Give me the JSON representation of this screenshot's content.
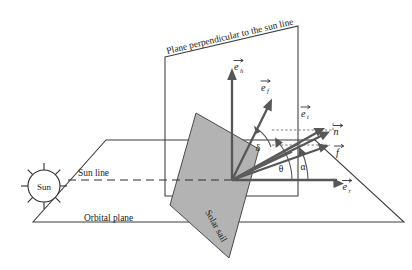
{
  "figure": {
    "background_color": "#ffffff",
    "sail_fill_color": "#b3b3b3",
    "line_color": "#3c3c3c",
    "vector_color": "#575757"
  },
  "labels": {
    "sun": "Sun",
    "sun_line": "Sun line",
    "orbital_plane": "Orbital plane",
    "perpendicular_plane": "Plane perpendicular to the sun line",
    "solar_sail": "Solar sail"
  },
  "vectors": [
    {
      "id": "e_h",
      "base": "e",
      "sub": "h",
      "label": "e_h",
      "description": "out-of-plane unit vector"
    },
    {
      "id": "e_f",
      "base": "e",
      "sub": "f",
      "label": "e_f",
      "description": "transverse unit vector"
    },
    {
      "id": "e_t",
      "base": "e",
      "sub": "t",
      "label": "e_t",
      "description": "tangential unit vector"
    },
    {
      "id": "e_r",
      "base": "e",
      "sub": "r",
      "label": "e_r",
      "description": "radial unit vector"
    },
    {
      "id": "n",
      "base": "n",
      "sub": "",
      "label": "n",
      "description": "sail normal vector"
    },
    {
      "id": "f",
      "base": "f",
      "sub": "",
      "label": "f",
      "description": "thrust force vector"
    }
  ],
  "angles": [
    {
      "id": "delta",
      "symbol": "δ",
      "description": "elevation / clock angle"
    },
    {
      "id": "theta",
      "symbol": "θ",
      "description": "cone angle of thrust from radial"
    },
    {
      "id": "alpha",
      "symbol": "α",
      "description": "sail pitch angle from radial"
    }
  ]
}
